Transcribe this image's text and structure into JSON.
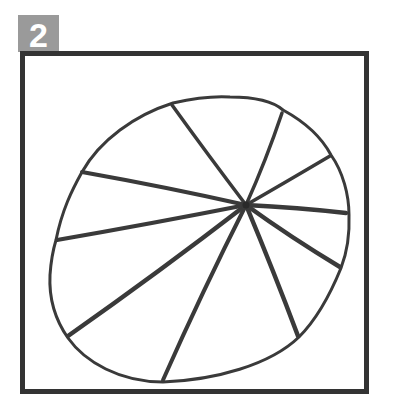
{
  "step": {
    "number": "2",
    "badge_color": "#9a9a9a",
    "text_color": "#ffffff"
  },
  "frame": {
    "border_color": "#333333"
  },
  "drawing": {
    "stroke_color": "#3a3a3a",
    "center": [
      246,
      205
    ],
    "outline_path": "M 173 103 C 195 98, 215 96, 230 97 C 260 97, 275 103, 283 110 C 305 122, 322 138, 331 155 C 343 172, 349 195, 349 215 C 350 240, 346 255, 341 268 C 330 295, 316 320, 299 337 C 270 365, 215 380, 163 382 C 120 382, 85 362, 68 338 C 54 318, 49 295, 50 275 C 51 260, 53 250, 56 240 C 62 210, 72 190, 82 172 C 100 140, 135 115, 173 103 Z",
    "spokes": [
      {
        "to": [
          172,
          105
        ],
        "width": 3.5
      },
      {
        "to": [
          282,
          113
        ],
        "width": 3.5
      },
      {
        "to": [
          330,
          156
        ],
        "width": 3.5
      },
      {
        "to": [
          346,
          213
        ],
        "width": 4.5
      },
      {
        "to": [
          340,
          267
        ],
        "width": 4.5
      },
      {
        "to": [
          298,
          336
        ],
        "width": 4.5
      },
      {
        "to": [
          163,
          380
        ],
        "width": 4
      },
      {
        "to": [
          68,
          336
        ],
        "width": 4.5
      },
      {
        "to": [
          57,
          240
        ],
        "width": 4
      },
      {
        "to": [
          82,
          172
        ],
        "width": 4
      }
    ]
  }
}
